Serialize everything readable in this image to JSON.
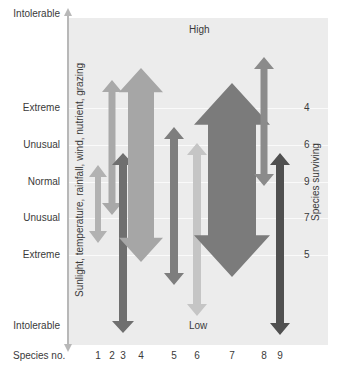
{
  "diagram": {
    "top_label": "High",
    "bottom_label": "Low",
    "y_axis_title": "Sunlight, temperature, rainfall, wind, nutrient, grazing",
    "right_axis_title": "Species surviving",
    "x_axis_title": "Species no.",
    "y_levels": [
      {
        "label": "Intolerable",
        "y": 14
      },
      {
        "label": "Extreme",
        "y": 108
      },
      {
        "label": "Unusual",
        "y": 145
      },
      {
        "label": "Normal",
        "y": 182
      },
      {
        "label": "Unusual",
        "y": 218
      },
      {
        "label": "Extreme",
        "y": 255
      },
      {
        "label": "Intolerable",
        "y": 326
      }
    ],
    "species_surviving": [
      {
        "level": "Extreme (high)",
        "count": "4",
        "y": 108
      },
      {
        "level": "Unusual (high)",
        "count": "6",
        "y": 145
      },
      {
        "level": "Normal",
        "count": "9",
        "y": 182
      },
      {
        "level": "Unusual (low)",
        "count": "7",
        "y": 218
      },
      {
        "level": "Extreme (low)",
        "count": "5",
        "y": 255
      }
    ],
    "species": [
      {
        "no": "1",
        "x": 98,
        "top": 165,
        "bottom": 243,
        "shaft": 6,
        "head": 18,
        "color": "#b2b2b2"
      },
      {
        "no": "2",
        "x": 112,
        "top": 80,
        "bottom": 215,
        "shaft": 7,
        "head": 20,
        "color": "#a9a9a9"
      },
      {
        "no": "3",
        "x": 123,
        "top": 153,
        "bottom": 333,
        "shaft": 8,
        "head": 22,
        "color": "#6f6f6f"
      },
      {
        "no": "4",
        "x": 141,
        "top": 68,
        "bottom": 262,
        "shaft": 26,
        "head": 44,
        "color": "#a6a6a6"
      },
      {
        "no": "5",
        "x": 174,
        "top": 127,
        "bottom": 285,
        "shaft": 8,
        "head": 20,
        "color": "#7e7e7e"
      },
      {
        "no": "6",
        "x": 197,
        "top": 143,
        "bottom": 316,
        "shaft": 8,
        "head": 20,
        "color": "#c5c5c5"
      },
      {
        "no": "7",
        "x": 232,
        "top": 83,
        "bottom": 277,
        "shaft": 48,
        "head": 76,
        "color": "#7b7b7b"
      },
      {
        "no": "8",
        "x": 264,
        "top": 57,
        "bottom": 186,
        "shaft": 7,
        "head": 20,
        "color": "#8b8b8b"
      },
      {
        "no": "9",
        "x": 280,
        "top": 153,
        "bottom": 335,
        "shaft": 8,
        "head": 20,
        "color": "#505050"
      }
    ]
  }
}
